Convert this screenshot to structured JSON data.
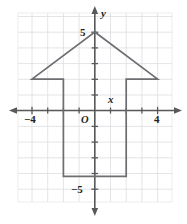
{
  "figure": {
    "axis_labels": {
      "x": "x",
      "y": "y"
    },
    "origin_label": "O",
    "tick_labels": {
      "x_negative": "−4",
      "x_positive": "4",
      "y_positive": "5",
      "y_negative": "−5"
    },
    "colors": {
      "grid": "#dcdde1",
      "axis": "#58595b",
      "shape_stroke": "#6d6e71",
      "text": "#231f20",
      "background": "#ffffff"
    }
  },
  "chart_data": {
    "type": "scatter",
    "title": "",
    "xlabel": "x",
    "ylabel": "y",
    "xlim": [
      -4.9,
      4.9
    ],
    "ylim": [
      -6.2,
      6.2
    ],
    "grid": true,
    "grid_step": 1,
    "legend": "none",
    "x_ticks": [
      -4,
      4
    ],
    "x_tick_labels": [
      "−4",
      "4"
    ],
    "y_ticks": [
      5,
      -5
    ],
    "y_tick_labels": [
      "5",
      "−5"
    ],
    "x_minor_ticks": [
      -3,
      -2,
      -1,
      1,
      2,
      3
    ],
    "y_minor_ticks": [
      4,
      3,
      2,
      1,
      -1,
      -2,
      -3,
      -4
    ],
    "annotations": [
      {
        "text": "O",
        "x": -0.55,
        "y": -0.75
      }
    ],
    "series": [
      {
        "name": "arrow-polygon",
        "type": "polygon",
        "closed": true,
        "points": [
          [
            0,
            5
          ],
          [
            4,
            2
          ],
          [
            2,
            2
          ],
          [
            2,
            -4.2
          ],
          [
            -2,
            -4.2
          ],
          [
            -2,
            2
          ],
          [
            -4,
            2
          ]
        ]
      }
    ]
  }
}
